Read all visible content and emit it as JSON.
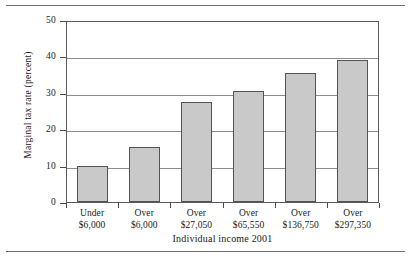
{
  "chart_data": {
    "type": "bar",
    "title": "",
    "xlabel": "Individual income 2001",
    "ylabel": "Marginal tax rate (percent)",
    "categories": [
      "Under $6,000",
      "Over $6,000",
      "Over $27,050",
      "Over $65,550",
      "Over $136,750",
      "Over $297,350"
    ],
    "category_lines": [
      {
        "line1": "Under",
        "line2": "$6,000"
      },
      {
        "line1": "Over",
        "line2": "$6,000"
      },
      {
        "line1": "Over",
        "line2": "$27,050"
      },
      {
        "line1": "Over",
        "line2": "$65,550"
      },
      {
        "line1": "Over",
        "line2": "$136,750"
      },
      {
        "line1": "Over",
        "line2": "$297,350"
      }
    ],
    "values": [
      10,
      15,
      27.5,
      30.5,
      35.5,
      39.1
    ],
    "ylim": [
      0,
      50
    ],
    "yticks": [
      0,
      10,
      20,
      30,
      40,
      50
    ],
    "ytick_labels": [
      "0",
      "10",
      "20",
      "30",
      "40",
      "50"
    ],
    "grid": "horizontal",
    "legend": "none",
    "bar_fill_color": "#c9c9c9",
    "bar_edge_color": "#545454",
    "gridline_color": "#8c8c8c",
    "frame_color": "#5a5a5a"
  }
}
